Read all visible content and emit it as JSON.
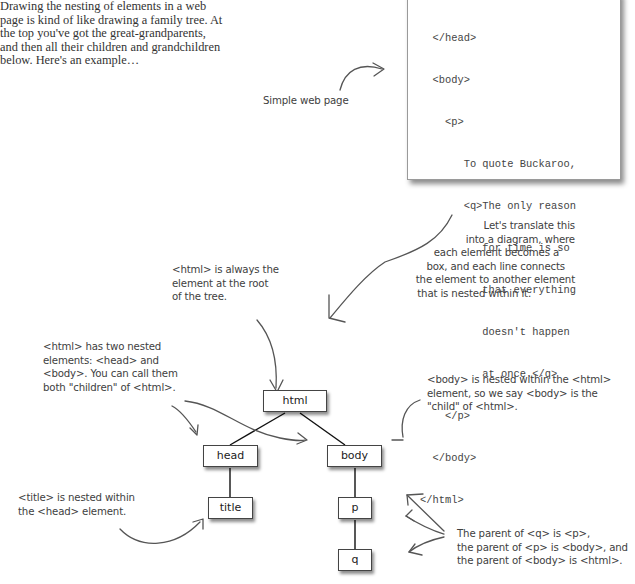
{
  "intro": {
    "lines": [
      "Drawing the nesting of elements in a web",
      "page is kind of like drawing a family tree. At",
      "the top you've got the great-grandparents,",
      "and then all their children and grandchildren",
      "below. Here's an example…"
    ]
  },
  "code_snippet": {
    "lines": [
      "  </head>",
      "  <body>",
      "    <p>",
      "       To quote Buckaroo,",
      "       <q>The only reason",
      "          for time is so",
      "          that everything",
      "          doesn't happen",
      "          at once.</q>",
      "    </p>",
      "  </body>",
      "</html>"
    ]
  },
  "annotations": {
    "simple_web_page": "Simple web page",
    "translate": [
      "Let's translate this",
      "into a diagram, where",
      "each element becomes a",
      "box, and each line connects",
      "the element to another element",
      "that is nested within it."
    ],
    "html_root": [
      "<html> is always the",
      "element at the root",
      "of the tree."
    ],
    "html_children": [
      "<html> has two nested",
      "elements: <head> and",
      "<body>. You can call them",
      "both \"children\" of <html>."
    ],
    "body_child": [
      "<body> is nested within the <html>",
      "element, so we say <body> is the",
      "\"child\" of <html>."
    ],
    "title_nested": [
      "<title> is nested within",
      "the <head> element."
    ],
    "parents": [
      "The parent of <q> is <p>,",
      "the parent of <p> is <body>, and",
      "the parent of <body> is <html>."
    ]
  },
  "tree": {
    "nodes": {
      "html": "html",
      "head": "head",
      "body": "body",
      "title": "title",
      "p": "p",
      "q": "q"
    },
    "edges": [
      [
        "html",
        "head"
      ],
      [
        "html",
        "body"
      ],
      [
        "head",
        "title"
      ],
      [
        "body",
        "p"
      ],
      [
        "p",
        "q"
      ]
    ]
  }
}
